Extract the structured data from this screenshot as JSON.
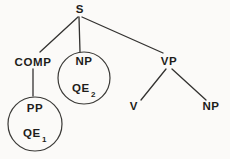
{
  "diagram": {
    "kind": "syntax-tree",
    "colors": {
      "ink": "#333230",
      "text": "#1e1d1b",
      "paper": "#fbfaf8"
    },
    "nodes": {
      "s": {
        "label": "S"
      },
      "comp": {
        "label": "COMP"
      },
      "np_subject": {
        "label": "NP",
        "qe_label": "QE",
        "qe_sub": "2",
        "circled": "true"
      },
      "vp": {
        "label": "VP"
      },
      "pp": {
        "label": "PP",
        "qe_label": "QE",
        "qe_sub": "1",
        "circled": "true"
      },
      "v": {
        "label": "V"
      },
      "np_object": {
        "label": "NP"
      }
    },
    "edges": [
      {
        "from": "S",
        "to": "COMP"
      },
      {
        "from": "S",
        "to": "NP (circled)"
      },
      {
        "from": "S",
        "to": "VP"
      },
      {
        "from": "COMP",
        "to": "PP (circled)"
      },
      {
        "from": "VP",
        "to": "V"
      },
      {
        "from": "VP",
        "to": "NP"
      }
    ]
  }
}
